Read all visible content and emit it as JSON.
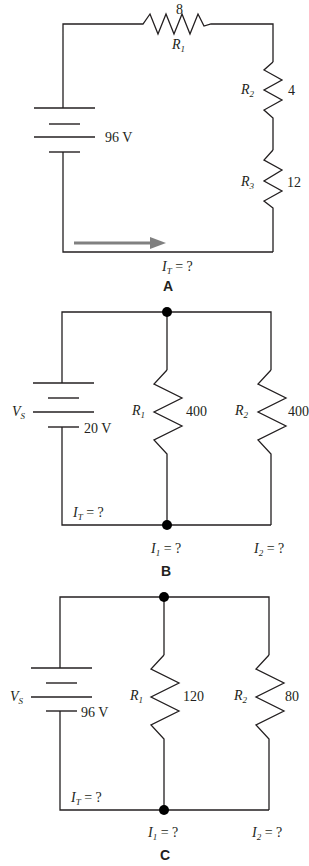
{
  "figures": [
    {
      "id": "A",
      "label": "A",
      "type": "series",
      "source": {
        "value": "96 V"
      },
      "resistors": [
        {
          "name": "R",
          "sub": "1",
          "value": "8"
        },
        {
          "name": "R",
          "sub": "2",
          "value": "4"
        },
        {
          "name": "R",
          "sub": "3",
          "value": "12"
        }
      ],
      "current": {
        "name": "I",
        "sub": "T",
        "eq": " = ?"
      },
      "arrow_color": "#808080"
    },
    {
      "id": "B",
      "label": "B",
      "type": "parallel",
      "source": {
        "name": "V",
        "sub": "S",
        "value": "20 V"
      },
      "resistors": [
        {
          "name": "R",
          "sub": "1",
          "value": "400"
        },
        {
          "name": "R",
          "sub": "2",
          "value": "400"
        }
      ],
      "currents": [
        {
          "name": "I",
          "sub": "T",
          "eq": " = ?"
        },
        {
          "name": "I",
          "sub": "1",
          "eq": " = ?"
        },
        {
          "name": "I",
          "sub": "2",
          "eq": " = ?"
        }
      ]
    },
    {
      "id": "C",
      "label": "C",
      "type": "parallel",
      "source": {
        "name": "V",
        "sub": "S",
        "value": "96 V"
      },
      "resistors": [
        {
          "name": "R",
          "sub": "1",
          "value": "120"
        },
        {
          "name": "R",
          "sub": "2",
          "value": "80"
        }
      ],
      "currents": [
        {
          "name": "I",
          "sub": "T",
          "eq": " = ?"
        },
        {
          "name": "I",
          "sub": "1",
          "eq": " = ?"
        },
        {
          "name": "I",
          "sub": "2",
          "eq": " = ?"
        }
      ]
    }
  ]
}
